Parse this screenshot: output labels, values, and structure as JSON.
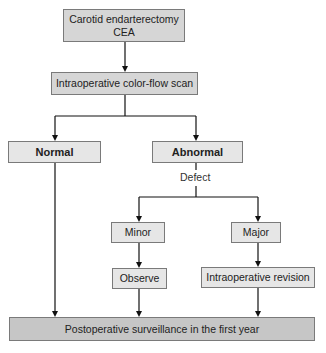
{
  "diagram": {
    "type": "flowchart",
    "nodes": {
      "cea": {
        "line1": "Carotid endarterectomy",
        "line2": "CEA"
      },
      "scan": {
        "label": "Intraoperative color-flow scan"
      },
      "normal": {
        "label": "Normal"
      },
      "abnormal": {
        "label": "Abnormal"
      },
      "minor": {
        "label": "Minor"
      },
      "major": {
        "label": "Major"
      },
      "observe": {
        "label": "Observe"
      },
      "revision": {
        "label": "Intraoperative revision"
      },
      "surveillance": {
        "label": "Postoperative surveillance in the first year"
      }
    },
    "edge_labels": {
      "defect": "Defect"
    },
    "edges": [
      {
        "from": "cea",
        "to": "scan"
      },
      {
        "from": "scan",
        "to": "normal"
      },
      {
        "from": "scan",
        "to": "abnormal"
      },
      {
        "from": "abnormal",
        "to": "minor",
        "label": "Defect"
      },
      {
        "from": "abnormal",
        "to": "major",
        "label": "Defect"
      },
      {
        "from": "minor",
        "to": "observe"
      },
      {
        "from": "major",
        "to": "revision"
      },
      {
        "from": "normal",
        "to": "surveillance"
      },
      {
        "from": "observe",
        "to": "surveillance"
      },
      {
        "from": "revision",
        "to": "surveillance"
      }
    ],
    "colors": {
      "line": "#111111",
      "box_border": "#7a7a7a",
      "fill_mid": "#d6d6d6",
      "fill_light": "#e6e6e6",
      "fill_dark": "#c6c6c6"
    }
  }
}
